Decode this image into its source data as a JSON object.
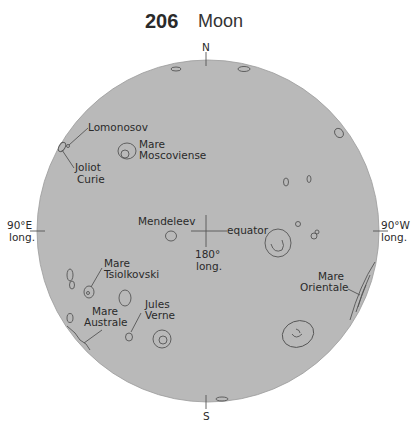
{
  "header": {
    "page_number": "206",
    "title": "Moon"
  },
  "map": {
    "colors": {
      "disk": "#b9b9b9",
      "ink": "#555555",
      "background": "#ffffff"
    },
    "directions": {
      "north": "N",
      "south": "S"
    },
    "longitude_labels": {
      "east": {
        "line1": "90°E",
        "line2": "long."
      },
      "west": {
        "line1": "90°W",
        "line2": "long."
      },
      "center": {
        "line1": "180°",
        "line2": "long."
      }
    },
    "equator_label": "equator",
    "features": [
      {
        "name": "Lomonosov"
      },
      {
        "name": "Joliot Curie",
        "line1": "Joliot",
        "line2": "Curie"
      },
      {
        "name": "Mare Moscoviense",
        "line1": "Mare",
        "line2": "Moscoviense"
      },
      {
        "name": "Mendeleev"
      },
      {
        "name": "Mare Tsiolkovski",
        "line1": "Mare",
        "line2": "Tsiolkovski"
      },
      {
        "name": "Mare Australe",
        "line1": "Mare",
        "line2": "Australe"
      },
      {
        "name": "Jules Verne",
        "line1": "Jules",
        "line2": "Verne"
      },
      {
        "name": "Mare Orientale",
        "line1": "Mare",
        "line2": "Orientale"
      }
    ]
  }
}
